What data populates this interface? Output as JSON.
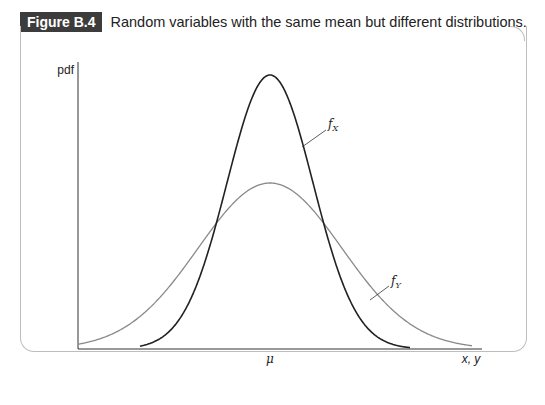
{
  "caption": {
    "label": "Figure B.4",
    "title": "Random variables with the same mean but different distributions."
  },
  "axes": {
    "y_label": "pdf",
    "x_label": "x, y",
    "x_tick": "μ"
  },
  "curves": {
    "fx_label": "f",
    "fx_sub": "X",
    "fy_label": "f",
    "fy_sub": "Y"
  },
  "colors": {
    "fx": "#222222",
    "fy": "#8a8a8a",
    "axis": "#333333"
  },
  "chart_data": {
    "type": "line",
    "title": "Random variables with the same mean but different distributions.",
    "xlabel": "x, y",
    "ylabel": "pdf",
    "x_ticks": [
      "μ"
    ],
    "grid": false,
    "series": [
      {
        "name": "f_X",
        "description": "narrow normal density centered at μ, taller peak",
        "mean": "μ",
        "relative_peak_height": 1.0,
        "relative_spread": 1.0
      },
      {
        "name": "f_Y",
        "description": "wide normal density centered at μ, lower peak",
        "mean": "μ",
        "relative_peak_height": 0.6,
        "relative_spread": 1.7
      }
    ]
  }
}
